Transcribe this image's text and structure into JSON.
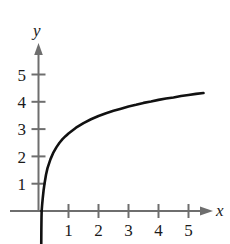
{
  "chart_data": {
    "type": "line",
    "title": "",
    "subtitle": "",
    "xlabel": "x",
    "ylabel": "y",
    "xlim": [
      -0.3,
      5.8
    ],
    "ylim": [
      -1.2,
      5.9
    ],
    "grid": false,
    "legend": null,
    "x_ticks": [
      1,
      2,
      3,
      4,
      5
    ],
    "x_tick_labels": [
      "1",
      "2",
      "3",
      "4",
      "5"
    ],
    "y_ticks": [
      1,
      2,
      3,
      4,
      5
    ],
    "y_tick_labels": [
      "1",
      "2",
      "3",
      "4",
      "5"
    ],
    "axis_arrows": [
      "x-positive",
      "y-positive"
    ],
    "series": [
      {
        "name": "curve",
        "color": "#111111",
        "linewidth": 2.6,
        "x": [
          0.105,
          0.12,
          0.14,
          0.17,
          0.2,
          0.25,
          0.3,
          0.4,
          0.5,
          0.6,
          0.7,
          0.8,
          0.9,
          1.0,
          1.25,
          1.5,
          1.75,
          2.0,
          2.25,
          2.5,
          2.75,
          3.0,
          3.25,
          3.5,
          3.75,
          4.0,
          4.25,
          4.5,
          4.75,
          5.0,
          5.25,
          5.5
        ],
        "y": [
          0.0,
          0.21,
          0.45,
          0.76,
          1.0,
          1.33,
          1.57,
          1.9,
          2.15,
          2.34,
          2.5,
          2.63,
          2.74,
          2.84,
          3.05,
          3.22,
          3.36,
          3.48,
          3.58,
          3.67,
          3.75,
          3.83,
          3.89,
          3.96,
          4.01,
          4.07,
          4.12,
          4.16,
          4.21,
          4.25,
          4.29,
          4.32
        ]
      }
    ]
  },
  "labels": {
    "y_axis_name": "y",
    "x_axis_name": "x",
    "y5": "5",
    "y4": "4",
    "y3": "3",
    "y2": "2",
    "y1": "1",
    "x1": "1",
    "x2": "2",
    "x3": "3",
    "x4": "4",
    "x5": "5"
  },
  "style": {
    "axis_color": "#6e6e6e",
    "curve_color": "#111111",
    "text_color": "#1a1a1a",
    "background": "#ffffff"
  }
}
